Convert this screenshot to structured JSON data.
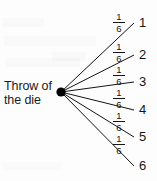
{
  "diagram": {
    "type": "probability-tree",
    "root_label_line1": "Throw of",
    "root_label_line2": "the die",
    "root_point": {
      "x": 61,
      "y": 92
    },
    "branch_count": 6,
    "branches": [
      {
        "outcome": "1",
        "probability": "1/6",
        "numerator": "1",
        "denominator": "6",
        "end_x": 134,
        "end_y": 23,
        "frac_x": 112,
        "frac_y": 12
      },
      {
        "outcome": "2",
        "probability": "1/6",
        "numerator": "1",
        "denominator": "6",
        "end_x": 134,
        "end_y": 55,
        "frac_x": 112,
        "frac_y": 42
      },
      {
        "outcome": "3",
        "probability": "1/6",
        "numerator": "1",
        "denominator": "6",
        "end_x": 134,
        "end_y": 82,
        "frac_x": 112,
        "frac_y": 65
      },
      {
        "outcome": "4",
        "probability": "1/6",
        "numerator": "1",
        "denominator": "6",
        "end_x": 134,
        "end_y": 110,
        "frac_x": 112,
        "frac_y": 88
      },
      {
        "outcome": "5",
        "probability": "1/6",
        "numerator": "1",
        "denominator": "6",
        "end_x": 134,
        "end_y": 137,
        "frac_x": 112,
        "frac_y": 111
      },
      {
        "outcome": "6",
        "probability": "1/6",
        "numerator": "1",
        "denominator": "6",
        "end_x": 134,
        "end_y": 166,
        "frac_x": 112,
        "frac_y": 134
      }
    ],
    "colors": {
      "ink": "#141414",
      "background": "#fdfdfd",
      "node": "#000000"
    }
  }
}
